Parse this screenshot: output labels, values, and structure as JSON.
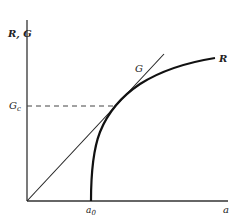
{
  "diagram": {
    "y_axis_label": "R, G",
    "x_axis_label": "a",
    "line_label": "G",
    "curve_label": "R",
    "critical_value_label": "Gc",
    "x_marker_label": "a0",
    "colors": {
      "ink": "#222222",
      "dashed": "#444444"
    }
  }
}
